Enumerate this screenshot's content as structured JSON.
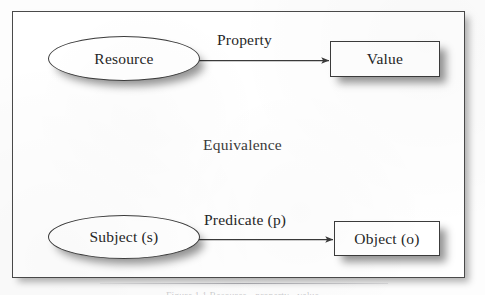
{
  "figure": {
    "kind": "scanned-book-diagram",
    "background_color": "#ffffff",
    "frame_border_color": "#4a4a4a",
    "text_color": "#262626",
    "shadow_color": "rgba(0,0,0,0.42)"
  },
  "diagram": {
    "title_annotation": "Equivalence",
    "nodes": [
      {
        "id": "resource",
        "label": "Resource",
        "shape": "ellipse",
        "row": "top"
      },
      {
        "id": "value",
        "label": "Value",
        "shape": "rectangle",
        "row": "top"
      },
      {
        "id": "subject",
        "label": "Subject (s)",
        "shape": "ellipse",
        "row": "bottom"
      },
      {
        "id": "object",
        "label": "Object (o)",
        "shape": "rectangle",
        "row": "bottom"
      }
    ],
    "edges": [
      {
        "id": "property",
        "label": "Property",
        "from": "resource",
        "to": "value",
        "arrow": "single"
      },
      {
        "id": "predicate",
        "label": "Predicate (p)",
        "from": "subject",
        "to": "object",
        "arrow": "single"
      }
    ]
  },
  "caption": {
    "text": "Figure 1.1   Resource - property - value",
    "visible": "cropped"
  }
}
